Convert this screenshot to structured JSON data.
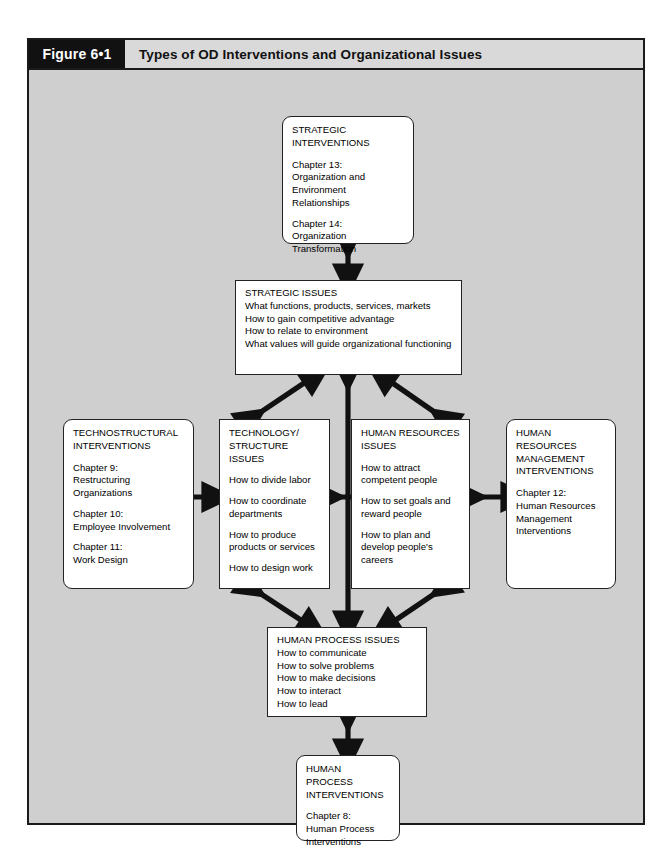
{
  "figure": {
    "number": "Figure 6•1",
    "caption": "Types of OD Interventions and Organizational Issues"
  },
  "colors": {
    "frame_border": "#1a1a1a",
    "frame_fill": "#cfcfcf",
    "number_cell_bg": "#111111",
    "number_cell_text": "#ffffff",
    "caption_cell_bg": "#d9d9d9",
    "node_fill": "#ffffff",
    "node_border": "#222222",
    "arrow": "#111111"
  },
  "nodes": {
    "strategic_interventions": {
      "title": "STRATEGIC\nINTERVENTIONS",
      "items": [
        "Chapter 13:\nOrganization and\nEnvironment Relationships",
        "Chapter 14:\nOrganization\nTransformation"
      ]
    },
    "strategic_issues": {
      "title": "STRATEGIC ISSUES",
      "lines": [
        "What functions, products, services, markets",
        "How to gain competitive advantage",
        "How to relate to environment",
        "What values will guide organizational functioning"
      ]
    },
    "technostructural_interventions": {
      "title": "TECHNOSTRUCTURAL\nINTERVENTIONS",
      "items": [
        "Chapter 9:\nRestructuring Organizations",
        "Chapter 10:\nEmployee Involvement",
        "Chapter 11:\nWork Design"
      ]
    },
    "technology_structure_issues": {
      "title": "TECHNOLOGY/\nSTRUCTURE ISSUES",
      "items": [
        "How to divide labor",
        "How to coordinate\ndepartments",
        "How to produce\nproducts or services",
        "How to design work"
      ]
    },
    "human_resources_issues": {
      "title": "HUMAN RESOURCES\nISSUES",
      "items": [
        "How to attract\ncompetent people",
        "How to set goals and\nreward people",
        "How to plan and\ndevelop people's\ncareers"
      ]
    },
    "human_resources_management_interventions": {
      "title": "HUMAN RESOURCES\nMANAGEMENT\nINTERVENTIONS",
      "items": [
        "Chapter 12:\nHuman Resources\nManagement\nInterventions"
      ]
    },
    "human_process_issues": {
      "title": "HUMAN PROCESS ISSUES",
      "lines": [
        "How to communicate",
        "How to solve problems",
        "How to make decisions",
        "How to interact",
        "How to lead"
      ]
    },
    "human_process_interventions": {
      "title": "HUMAN PROCESS\nINTERVENTIONS",
      "items": [
        "Chapter 8:\nHuman Process\nInterventions"
      ]
    }
  },
  "connections": [
    {
      "name": "strategic-interventions-to-strategic-issues",
      "style": "double-headed-vertical"
    },
    {
      "name": "technology-structure-issues-to-strategic-issues",
      "style": "double-headed-diagonal"
    },
    {
      "name": "human-process-issues-to-strategic-issues",
      "style": "double-headed-vertical"
    },
    {
      "name": "human-resources-issues-to-strategic-issues",
      "style": "double-headed-diagonal"
    },
    {
      "name": "technostructural-interventions-to-technology-structure-issues",
      "style": "double-headed-horizontal"
    },
    {
      "name": "technology-structure-issues-to-human-resources-issues",
      "style": "double-headed-horizontal"
    },
    {
      "name": "human-resources-issues-to-hrm-interventions",
      "style": "double-headed-horizontal"
    },
    {
      "name": "technology-structure-issues-to-human-process-issues",
      "style": "double-headed-diagonal"
    },
    {
      "name": "human-resources-issues-to-human-process-issues",
      "style": "double-headed-diagonal"
    },
    {
      "name": "human-process-issues-to-human-process-interventions",
      "style": "double-headed-vertical"
    }
  ]
}
